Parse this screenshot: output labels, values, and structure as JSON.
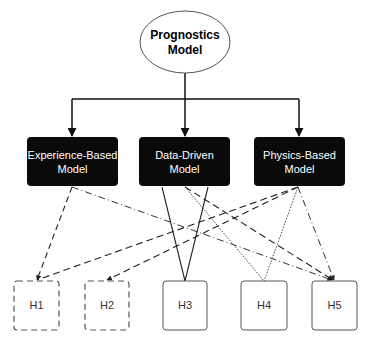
{
  "root": {
    "line1": "Prognostics",
    "line2": "Model"
  },
  "models": [
    {
      "line1": "Experience-Based",
      "line2": "Model"
    },
    {
      "line1": "Data-Driven",
      "line2": "Model"
    },
    {
      "line1": "Physics-Based",
      "line2": "Model"
    }
  ],
  "hypotheses": [
    {
      "label": "H1",
      "border": "dashed"
    },
    {
      "label": "H2",
      "border": "dashed"
    },
    {
      "label": "H3",
      "border": "solid"
    },
    {
      "label": "H4",
      "border": "solid"
    },
    {
      "label": "H5",
      "border": "solid"
    }
  ],
  "connections": [
    {
      "from": "Prognostics Model",
      "to": "Experience-Based Model",
      "style": "solid-arrow"
    },
    {
      "from": "Prognostics Model",
      "to": "Data-Driven Model",
      "style": "solid-arrow"
    },
    {
      "from": "Prognostics Model",
      "to": "Physics-Based Model",
      "style": "solid-arrow"
    },
    {
      "from": "Experience-Based Model",
      "to": "H1",
      "style": "dashed-arrow"
    },
    {
      "from": "Experience-Based Model",
      "to": "H5",
      "style": "dash-dot-arrow"
    },
    {
      "from": "Data-Driven Model",
      "to": "H3",
      "style": "solid"
    },
    {
      "from": "Data-Driven Model",
      "to": "H4",
      "style": "dotted"
    },
    {
      "from": "Data-Driven Model",
      "to": "H5",
      "style": "dashed-arrow"
    },
    {
      "from": "Physics-Based Model",
      "to": "H1",
      "style": "dashed"
    },
    {
      "from": "Physics-Based Model",
      "to": "H2",
      "style": "dashed-arrow"
    },
    {
      "from": "Physics-Based Model",
      "to": "H4",
      "style": "dotted"
    },
    {
      "from": "Physics-Based Model",
      "to": "H5",
      "style": "dash-dot-arrow"
    }
  ],
  "colors": {
    "model_fill": "#0a0a0a",
    "model_text": "#ffffff",
    "line": "#222222",
    "h_border": "#555555"
  }
}
